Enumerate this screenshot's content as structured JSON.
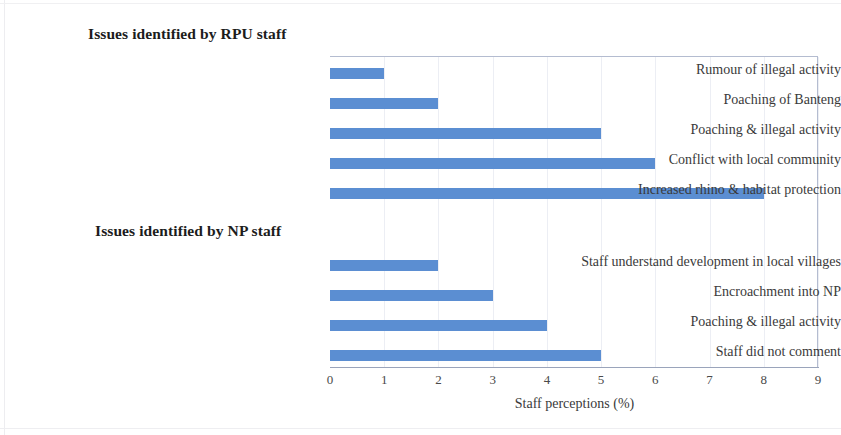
{
  "chart_data": {
    "type": "bar",
    "orientation": "horizontal",
    "title": "",
    "xlabel": "Staff perceptions (%)",
    "ylabel": "",
    "xlim": [
      0,
      9
    ],
    "xticks": [
      "0",
      "1",
      "2",
      "3",
      "4",
      "5",
      "6",
      "7",
      "8",
      "9"
    ],
    "grid": true,
    "legend": false,
    "bar_color": "#5b8ed2",
    "groups": [
      {
        "heading": "Issues identified by RPU staff",
        "categories": [
          "Rumour of illegal activity",
          "Poaching of Banteng",
          "Poaching & illegal activity",
          "Conflict with local community",
          "Increased rhino & habitat protection"
        ],
        "values": [
          1,
          2,
          5,
          6,
          8
        ]
      },
      {
        "heading": "Issues identified by NP staff",
        "categories": [
          "Staff understand development in local villages",
          "Encroachment into NP",
          "Poaching & illegal activity",
          "Staff did not comment"
        ],
        "values": [
          2,
          3,
          4,
          5
        ]
      }
    ]
  }
}
